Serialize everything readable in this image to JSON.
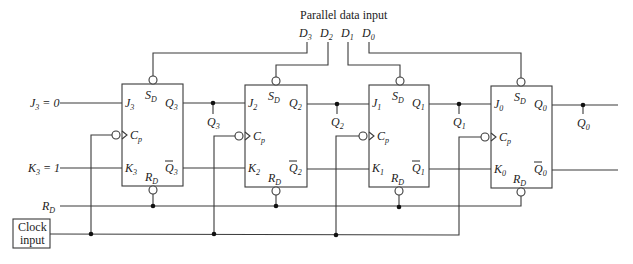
{
  "diagram": {
    "title": "Parallel data input",
    "data_inputs": [
      {
        "label": "D",
        "sub": "3"
      },
      {
        "label": "D",
        "sub": "2"
      },
      {
        "label": "D",
        "sub": "1"
      },
      {
        "label": "D",
        "sub": "0"
      }
    ],
    "left_inputs": {
      "j3": {
        "label": "J",
        "sub": "3",
        "value": " = 0"
      },
      "k3": {
        "label": "K",
        "sub": "3",
        "value": " = 1"
      },
      "rd": {
        "label": "R",
        "sub": "D"
      }
    },
    "clock": {
      "line1": "Clock",
      "line2": "input"
    },
    "flipflops": [
      {
        "j": "3",
        "k": "3",
        "q": "3",
        "sd": "S",
        "rd": "R",
        "cp": "C",
        "cp_sub": "p",
        "d_sub": "D"
      },
      {
        "j": "2",
        "k": "2",
        "q": "2",
        "sd": "S",
        "rd": "R",
        "cp": "C",
        "cp_sub": "p",
        "d_sub": "D"
      },
      {
        "j": "1",
        "k": "1",
        "q": "1",
        "sd": "S",
        "rd": "R",
        "cp": "C",
        "cp_sub": "p",
        "d_sub": "D"
      },
      {
        "j": "0",
        "k": "0",
        "q": "0",
        "sd": "S",
        "rd": "R",
        "cp": "C",
        "cp_sub": "p",
        "d_sub": "D"
      }
    ],
    "outputs": [
      {
        "label": "Q",
        "sub": "3"
      },
      {
        "label": "Q",
        "sub": "2"
      },
      {
        "label": "Q",
        "sub": "1"
      },
      {
        "label": "Q",
        "sub": "0"
      }
    ]
  }
}
